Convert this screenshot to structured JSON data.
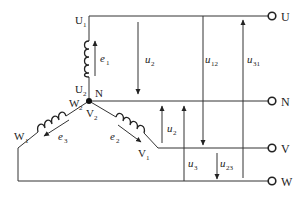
{
  "diagram": {
    "title": "",
    "colors": {
      "line": "#333333",
      "text": "#222222",
      "background": "#ffffff"
    },
    "nodes": {
      "neutral_point": "N",
      "winding_ends": {
        "U1": "U1",
        "U2": "U2",
        "V1": "V1",
        "V2": "V2",
        "W1": "W1",
        "W2": "W2"
      }
    },
    "terminals": [
      {
        "id": "U",
        "label": "U"
      },
      {
        "id": "N",
        "label": "N"
      },
      {
        "id": "V",
        "label": "V"
      },
      {
        "id": "W",
        "label": "W"
      }
    ],
    "windings": [
      {
        "id": "phase1",
        "from": "U2",
        "to": "U1",
        "emf": "e",
        "emf_sub": "1"
      },
      {
        "id": "phase2",
        "from": "V2",
        "to": "V1",
        "emf": "e",
        "emf_sub": "2"
      },
      {
        "id": "phase3",
        "from": "W2",
        "to": "W1",
        "emf": "e",
        "emf_sub": "3"
      }
    ],
    "voltages": [
      {
        "id": "u1_phase",
        "symbol": "u",
        "sub": "2",
        "note": "between U and N (arrow down)"
      },
      {
        "id": "u12",
        "symbol": "u",
        "sub": "12",
        "note": "between U and V (arrow down)"
      },
      {
        "id": "u31",
        "symbol": "u",
        "sub": "31",
        "note": "between W and U (arrow up)"
      },
      {
        "id": "u2_phase",
        "symbol": "u",
        "sub": "2",
        "note": "between V and N (arrow up)"
      },
      {
        "id": "u3_phase",
        "symbol": "u",
        "sub": "3",
        "note": "between W and N (arrow up)"
      },
      {
        "id": "u23",
        "symbol": "u",
        "sub": "23",
        "note": "between V and W (arrow down)"
      }
    ],
    "labels": {
      "U1": {
        "main": "U",
        "sub": "1"
      },
      "U2": {
        "main": "U",
        "sub": "2"
      },
      "N_node": "N",
      "W2": {
        "main": "W",
        "sub": "2"
      },
      "V2": {
        "main": "V",
        "sub": "2"
      },
      "W1": {
        "main": "W",
        "sub": "1"
      },
      "V1": {
        "main": "V",
        "sub": "1"
      },
      "e1": {
        "main": "e",
        "sub": "1"
      },
      "e2": {
        "main": "e",
        "sub": "2"
      },
      "e3": {
        "main": "e",
        "sub": "3"
      },
      "u_top": {
        "main": "u",
        "sub": "2"
      },
      "u12": {
        "main": "u",
        "sub": "12"
      },
      "u31": {
        "main": "u",
        "sub": "31"
      },
      "u_mid": {
        "main": "u",
        "sub": "2"
      },
      "u3": {
        "main": "u",
        "sub": "3"
      },
      "u23": {
        "main": "u",
        "sub": "23"
      },
      "term_U": "U",
      "term_N": "N",
      "term_V": "V",
      "term_W": "W"
    }
  }
}
